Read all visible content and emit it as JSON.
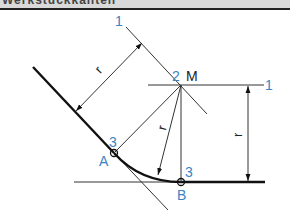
{
  "header": {
    "title": "Werkstückkanten"
  },
  "diagram": {
    "labels": {
      "step1_top": "1",
      "step1_right": "1",
      "step2": "2",
      "center": "M",
      "step3_a": "3",
      "step3_b": "3",
      "point_a": "A",
      "point_b": "B",
      "radius_parallel": "r",
      "radius_arc": "r",
      "radius_vertical": "r"
    },
    "colors": {
      "step_number": "#3a84c3",
      "line": "#222222",
      "title_bar": "#d9d9d9"
    }
  }
}
